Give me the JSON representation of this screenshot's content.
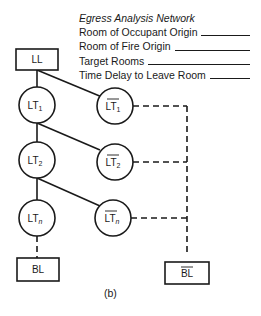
{
  "legend": {
    "title": "Egress Analysis Network",
    "fields": [
      {
        "label": "Room of Occupant Origin",
        "value": ""
      },
      {
        "label": "Room of Fire Origin",
        "value": ""
      },
      {
        "label": "Target Rooms",
        "value": ""
      },
      {
        "label": "Time Delay to Leave Room",
        "value": ""
      }
    ]
  },
  "nodes": {
    "start": {
      "label": "LL",
      "shape": "box"
    },
    "lt1": {
      "base": "LT",
      "sub": "1",
      "negated": false
    },
    "lt1_bar": {
      "base": "LT",
      "sub": "1",
      "negated": true
    },
    "lt2": {
      "base": "LT",
      "sub": "2",
      "negated": false
    },
    "lt2_bar": {
      "base": "LT",
      "sub": "2",
      "negated": true
    },
    "ltn": {
      "base": "LT",
      "sub": "n",
      "negated": false
    },
    "ltn_bar": {
      "base": "LT",
      "sub": "n",
      "negated": true
    },
    "end": {
      "label": "BL",
      "shape": "box",
      "negated": false
    },
    "end_bar": {
      "label": "BL",
      "shape": "box",
      "negated": true
    }
  },
  "edges": [
    {
      "from": "LL",
      "to": "LT1",
      "style": "solid"
    },
    {
      "from": "LL",
      "to": "LT1_bar",
      "style": "solid"
    },
    {
      "from": "LT1",
      "to": "LT2",
      "style": "solid"
    },
    {
      "from": "LT1",
      "to": "LT2_bar",
      "style": "solid"
    },
    {
      "from": "LT2",
      "to": "LTn",
      "style": "solid"
    },
    {
      "from": "LT2",
      "to": "LTn_bar",
      "style": "solid"
    },
    {
      "from": "LTn",
      "to": "BL",
      "style": "dashed"
    },
    {
      "from": "LT1_bar",
      "to": "BL_bar",
      "style": "dashed"
    },
    {
      "from": "LT2_bar",
      "to": "BL_bar",
      "style": "dashed"
    },
    {
      "from": "LTn_bar",
      "to": "BL_bar",
      "style": "dashed"
    }
  ],
  "caption": "(b)",
  "colors": {
    "stroke": "#1a1a1a",
    "background": "#ffffff"
  }
}
